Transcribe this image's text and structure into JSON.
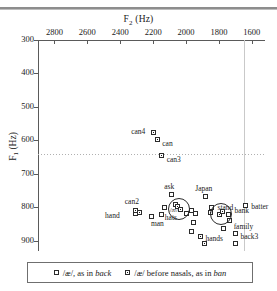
{
  "figure": {
    "x_axis": {
      "title": "F2 (Hz)",
      "title_base": "F",
      "title_sub": "2",
      "title_unit": "(Hz)",
      "ticks": [
        2800,
        2600,
        2400,
        2200,
        2000,
        1800,
        1600
      ],
      "min": 1520,
      "max": 2900,
      "reversed": true
    },
    "y_axis": {
      "title": "F1 (Hz)",
      "title_base": "F",
      "title_sub": "1",
      "title_unit": "(Hz)",
      "ticks": [
        300,
        400,
        500,
        600,
        700,
        800,
        900
      ],
      "min": 300,
      "max": 930,
      "reversed": true
    },
    "reference_lines": {
      "vertical_f2": 1650,
      "horizontal_f1": 640
    }
  },
  "chart_data": {
    "type": "scatter",
    "title": "",
    "xlabel": "F2 (Hz)",
    "ylabel": "F1 (Hz)",
    "xlim": [
      2900,
      1520
    ],
    "ylim": [
      930,
      300
    ],
    "grid": false,
    "legend_position": "bottom",
    "series": [
      {
        "name": "/æ/, as in back",
        "symbol": "open-square",
        "points": [
          {
            "label": "ask",
            "f2": 2090,
            "f1": 762,
            "label_dx": -2,
            "label_dy": -9,
            "label_align": "center"
          },
          {
            "label": "hand",
            "f2": 2310,
            "f1": 818,
            "label_dx": -30,
            "label_dy": 2,
            "label_align": "left"
          },
          {
            "label": "man",
            "f2": 2150,
            "f1": 822,
            "label_dx": -4,
            "label_dy": 8,
            "label_align": "center"
          },
          {
            "label": "hats",
            "f2": 1995,
            "f1": 818,
            "label_dx": -22,
            "label_dy": 4,
            "label_align": "left"
          },
          {
            "label": "",
            "f2": 1965,
            "f1": 808,
            "label_dx": 0,
            "label_dy": 0,
            "label_align": "center"
          },
          {
            "label": "",
            "f2": 1940,
            "f1": 818,
            "label_dx": 0,
            "label_dy": 0,
            "label_align": "center"
          },
          {
            "label": "",
            "f2": 1955,
            "f1": 845,
            "label_dx": 0,
            "label_dy": 0,
            "label_align": "center"
          },
          {
            "label": "Japan",
            "f2": 1880,
            "f1": 768,
            "label_dx": -2,
            "label_dy": -9,
            "label_align": "center"
          },
          {
            "label": "stand",
            "f2": 1845,
            "f1": 800,
            "label_dx": 6,
            "label_dy": 0,
            "label_align": "left"
          },
          {
            "label": "batter",
            "f2": 1640,
            "f1": 793,
            "label_dx": 6,
            "label_dy": 1,
            "label_align": "left"
          },
          {
            "label": "bank",
            "f2": 1742,
            "f1": 820,
            "label_dx": 6,
            "label_dy": -4,
            "label_align": "left"
          },
          {
            "label": "family",
            "f2": 1735,
            "f1": 838,
            "label_dx": 4,
            "label_dy": 6,
            "label_align": "left"
          },
          {
            "label": "back3",
            "f2": 1700,
            "f1": 878,
            "label_dx": 5,
            "label_dy": 2,
            "label_align": "left"
          },
          {
            "label": "",
            "f2": 1770,
            "f1": 862,
            "label_dx": 0,
            "label_dy": 0,
            "label_align": "center"
          },
          {
            "label": "",
            "f2": 1700,
            "f1": 908,
            "label_dx": 0,
            "label_dy": 0,
            "label_align": "center"
          },
          {
            "label": "",
            "f2": 1968,
            "f1": 873,
            "label_dx": 0,
            "label_dy": 0,
            "label_align": "center"
          },
          {
            "label": "",
            "f2": 2208,
            "f1": 826,
            "label_dx": 0,
            "label_dy": 0,
            "label_align": "center"
          },
          {
            "label": "",
            "f2": 2128,
            "f1": 800,
            "label_dx": 0,
            "label_dy": 0,
            "label_align": "center"
          },
          {
            "label": "",
            "f2": 2062,
            "f1": 790,
            "label_dx": 0,
            "label_dy": 0,
            "label_align": "center"
          }
        ]
      },
      {
        "name": "/æ/ before nasals, as in ban",
        "symbol": "filled-square",
        "points": [
          {
            "label": "can4",
            "f2": 2200,
            "f1": 577,
            "label_dx": -22,
            "label_dy": -2,
            "label_align": "left"
          },
          {
            "label": "can",
            "f2": 2175,
            "f1": 598,
            "label_dx": 5,
            "label_dy": 3,
            "label_align": "left"
          },
          {
            "label": "can3",
            "f2": 2148,
            "f1": 645,
            "label_dx": 5,
            "label_dy": 3,
            "label_align": "left"
          },
          {
            "label": "can2",
            "f2": 2305,
            "f1": 808,
            "label_dx": -4,
            "label_dy": -9,
            "label_align": "center"
          },
          {
            "label": "",
            "f2": 2285,
            "f1": 816,
            "label_dx": 0,
            "label_dy": 0,
            "label_align": "center"
          },
          {
            "label": "",
            "f2": 2052,
            "f1": 798,
            "label_dx": 0,
            "label_dy": 0,
            "label_align": "center"
          },
          {
            "label": "",
            "f2": 2035,
            "f1": 806,
            "label_dx": 0,
            "label_dy": 0,
            "label_align": "center"
          },
          {
            "label": "",
            "f2": 1852,
            "f1": 816,
            "label_dx": 0,
            "label_dy": 0,
            "label_align": "center"
          },
          {
            "label": "",
            "f2": 1795,
            "f1": 822,
            "label_dx": 0,
            "label_dy": 0,
            "label_align": "center"
          },
          {
            "label": "",
            "f2": 1780,
            "f1": 812,
            "label_dx": 0,
            "label_dy": 0,
            "label_align": "center"
          },
          {
            "label": "hands",
            "f2": 1912,
            "f1": 888,
            "label_dx": 5,
            "label_dy": 1,
            "label_align": "left"
          },
          {
            "label": "",
            "f2": 1888,
            "f1": 908,
            "label_dx": 0,
            "label_dy": 0,
            "label_align": "center"
          }
        ]
      }
    ],
    "group_circles": [
      {
        "name": "ash-group",
        "label": "/æ/",
        "f2": 2045,
        "f1": 805,
        "radius_px": 11
      },
      {
        "name": "nasal-ash-group",
        "label": "",
        "f2": 1790,
        "f1": 820,
        "radius_px": 11
      }
    ]
  },
  "legend": {
    "items": [
      {
        "symbol": "open-square",
        "text_pre": "/æ/, as in ",
        "text_italic": "back",
        "text_post": ""
      },
      {
        "symbol": "filled-square",
        "text_pre": "/æ/ before nasals, as in ",
        "text_italic": "ban",
        "text_post": ""
      }
    ]
  }
}
